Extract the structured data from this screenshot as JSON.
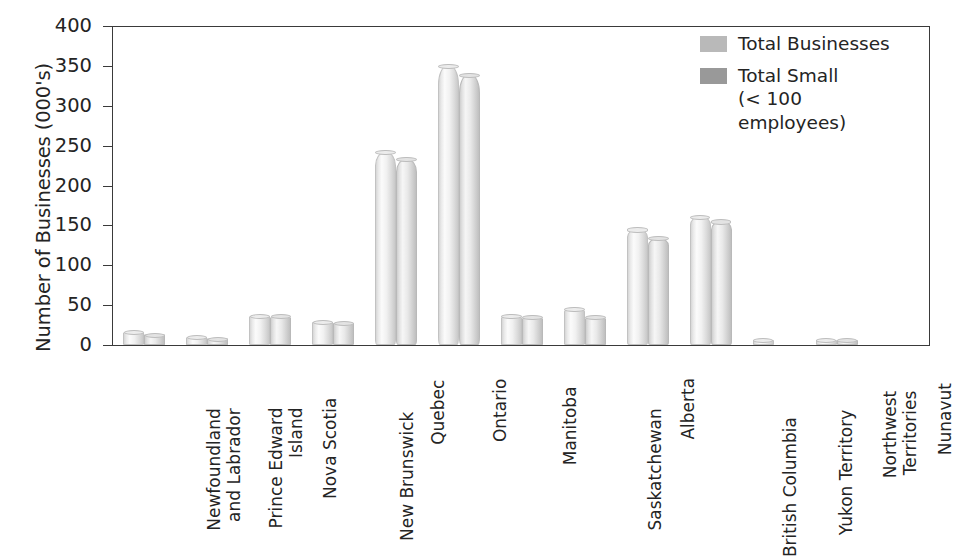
{
  "chart_data": {
    "type": "bar",
    "title": "",
    "xlabel": "",
    "ylabel": "Number of Businesses (000's)",
    "ylim": [
      0,
      400
    ],
    "yticks": [
      0,
      50,
      100,
      150,
      200,
      250,
      300,
      350,
      400
    ],
    "ytick_labels": [
      "0",
      "50",
      "100",
      "150",
      "200",
      "250",
      "300",
      "350",
      "400"
    ],
    "grid": false,
    "legend_position": "top-right",
    "categories": [
      "Newfoundland and Labrador",
      "Prince Edward Island",
      "Nova Scotia",
      "New Brunswick",
      "Quebec",
      "Ontario",
      "Manitoba",
      "Saskatchewan",
      "Alberta",
      "British Columbia",
      "Yukon Territory",
      "Northwest Territories",
      "Nunavut"
    ],
    "category_lines": [
      [
        "Newfoundland",
        "and Labrador"
      ],
      [
        "Prince Edward",
        "Island"
      ],
      [
        "Nova Scotia"
      ],
      [
        "New Brunswick"
      ],
      [
        "Quebec"
      ],
      [
        "Ontario"
      ],
      [
        "Manitoba"
      ],
      [
        "Saskatchewan"
      ],
      [
        "Alberta"
      ],
      [
        "British Columbia"
      ],
      [
        "Yukon Territory"
      ],
      [
        "Northwest",
        "Territories"
      ],
      [
        "Nunavut"
      ]
    ],
    "series": [
      {
        "name": "Total Businesses",
        "color": "#b9b9b9",
        "values": [
          14,
          8,
          35,
          27,
          240,
          348,
          34,
          43,
          143,
          159,
          4,
          4,
          0
        ]
      },
      {
        "name": "Total Small (< 100 employees)",
        "color": "#999999",
        "values": [
          11,
          6,
          34,
          26,
          231,
          337,
          33,
          33,
          132,
          153,
          0,
          4,
          0
        ]
      }
    ]
  },
  "legend": {
    "entries": [
      {
        "label_line1": "Total Businesses",
        "label_line2": ""
      },
      {
        "label_line1": "Total Small",
        "label_line2": "(< 100 employees)"
      }
    ]
  },
  "caption": {
    "text": ""
  }
}
